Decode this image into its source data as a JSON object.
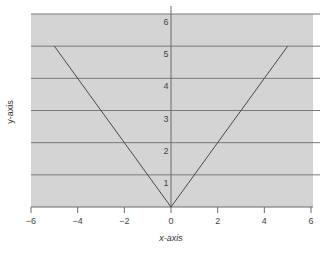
{
  "chart_data": {
    "type": "line",
    "title": "",
    "xlabel": "x-axis",
    "ylabel": "y-axis",
    "xlim": [
      -6,
      6
    ],
    "ylim": [
      0,
      6
    ],
    "x_ticks": [
      -6,
      -4,
      -2,
      0,
      2,
      4,
      6
    ],
    "x_tick_labels": [
      "−6",
      "−4",
      "−2",
      "0",
      "2",
      "4",
      "6"
    ],
    "y_ticks": [
      1,
      2,
      3,
      4,
      5,
      6
    ],
    "y_tick_labels": [
      "1",
      "2",
      "3",
      "4",
      "5",
      "6"
    ],
    "grid": "horizontal",
    "legend": null,
    "series": [
      {
        "name": "y = |x|",
        "x": [
          -5,
          0,
          5
        ],
        "y": [
          5,
          0,
          5
        ]
      }
    ]
  },
  "colors": {
    "plot_background": "#d4d4d4",
    "grid_line": "#7a7a7a",
    "axis_line": "#6a6a6a",
    "series_line": "#4a4a4a"
  }
}
